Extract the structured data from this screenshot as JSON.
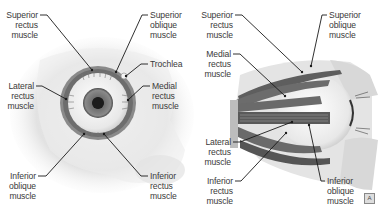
{
  "figure": {
    "left_panel": {
      "view": "anterior",
      "labels": [
        {
          "id": "superior-rectus",
          "text": "Superior\nrectus\nmuscle"
        },
        {
          "id": "superior-oblique",
          "text": "Superior\noblique\nmuscle"
        },
        {
          "id": "trochlea",
          "text": "Trochlea"
        },
        {
          "id": "lateral-rectus",
          "text": "Lateral\nrectus\nmuscle"
        },
        {
          "id": "medial-rectus",
          "text": "Medial\nrectus\nmuscle"
        },
        {
          "id": "inferior-oblique",
          "text": "Inferior\noblique\nmuscle"
        },
        {
          "id": "inferior-rectus",
          "text": "Inferior\nrectus\nmuscle"
        }
      ]
    },
    "right_panel": {
      "view": "lateral",
      "labels": [
        {
          "id": "superior-rectus",
          "text": "Superior\nrectus\nmuscle"
        },
        {
          "id": "superior-oblique",
          "text": "Superior\noblique\nmuscle"
        },
        {
          "id": "medial-rectus",
          "text": "Medial\nrectus\nmuscle"
        },
        {
          "id": "lateral-rectus",
          "text": "Lateral\nrectus\nmuscle"
        },
        {
          "id": "inferior-rectus",
          "text": "Inferior\nrectus\nmuscle"
        },
        {
          "id": "inferior-oblique",
          "text": "Inferior\noblique\nmuscle"
        }
      ]
    },
    "credit_icon": "A"
  }
}
